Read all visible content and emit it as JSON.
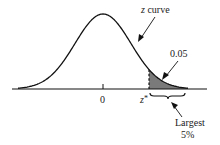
{
  "chart_data": {
    "type": "area",
    "title": "",
    "xlabel": "",
    "ylabel": "",
    "curve": "standard normal density",
    "curve_label": "z curve",
    "x_ticks": [
      {
        "label": "0",
        "value": 0
      },
      {
        "label": "z*",
        "value": 1.645
      }
    ],
    "shaded_region": {
      "from": "z*",
      "to": "+inf",
      "area": 0.05,
      "area_label": "0.05",
      "color": "#7a7a7a"
    },
    "annotations": [
      {
        "text": "z curve",
        "points_to": "curve"
      },
      {
        "text": "0.05",
        "points_to": "shaded tail area"
      },
      {
        "text": "Largest 5%",
        "points_to": "brace under upper tail"
      }
    ],
    "grid": false,
    "legend": null
  },
  "labels": {
    "curve": "z curve",
    "curve_italic": "z",
    "curve_rest": " curve",
    "area": "0.05",
    "zero": "0",
    "zstar_z": "z",
    "zstar_star": "*",
    "largest_line1": "Largest",
    "largest_line2": "5%"
  },
  "colors": {
    "line": "#111111",
    "shade": "#7a7a7a",
    "text": "#222222"
  }
}
